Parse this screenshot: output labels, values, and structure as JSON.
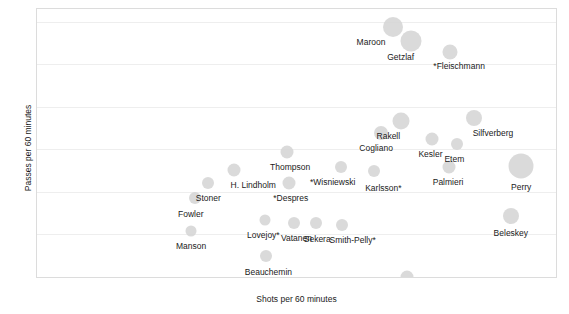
{
  "chart_data": {
    "type": "scatter",
    "title": "",
    "xlabel": "Shots per 60 minutes",
    "ylabel": "Passes per 60 minutes",
    "xlim": [
      0,
      10
    ],
    "ylim": [
      0,
      12.6
    ],
    "xticks": [
      0,
      1,
      2,
      3,
      4,
      5,
      6,
      7,
      8,
      9,
      10
    ],
    "yticks": [
      0,
      2,
      4,
      6,
      8,
      10,
      12
    ],
    "grid": true,
    "legend": "none",
    "size_encodes": "bubble area",
    "points": [
      {
        "label": "Maroon",
        "x": 6.86,
        "y": 11.75,
        "size": 20,
        "label_dx": -22,
        "label_dy": 10
      },
      {
        "label": "Getzlaf",
        "x": 7.2,
        "y": 11.1,
        "size": 21,
        "label_dx": -10,
        "label_dy": 11
      },
      {
        "label": "*Fleischmann",
        "x": 7.96,
        "y": 10.6,
        "size": 15,
        "label_dx": 9,
        "label_dy": 9
      },
      {
        "label": "Rakell",
        "x": 7.02,
        "y": 7.32,
        "size": 17,
        "label_dx": -13,
        "label_dy": 10
      },
      {
        "label": "Silfverberg",
        "x": 8.42,
        "y": 7.48,
        "size": 16,
        "label_dx": 19,
        "label_dy": 10
      },
      {
        "label": "Cogliano",
        "x": 6.63,
        "y": 6.78,
        "size": 14,
        "label_dx": -5,
        "label_dy": 10
      },
      {
        "label": "Kesler",
        "x": 7.62,
        "y": 6.5,
        "size": 13,
        "label_dx": -2,
        "label_dy": 10
      },
      {
        "label": "Etem",
        "x": 8.1,
        "y": 6.25,
        "size": 12,
        "label_dx": -3,
        "label_dy": 10
      },
      {
        "label": "Palmieri",
        "x": 7.94,
        "y": 5.18,
        "size": 13,
        "label_dx": -1,
        "label_dy": 10
      },
      {
        "label": "Perry",
        "x": 9.33,
        "y": 5.22,
        "size": 25,
        "label_dx": 0,
        "label_dy": 16
      },
      {
        "label": "Thompson",
        "x": 4.82,
        "y": 5.88,
        "size": 13,
        "label_dx": 3,
        "label_dy": 10
      },
      {
        "label": "*Wisniewski",
        "x": 5.85,
        "y": 5.18,
        "size": 12,
        "label_dx": -8,
        "label_dy": 10
      },
      {
        "label": "Karlsson*",
        "x": 6.5,
        "y": 4.98,
        "size": 12,
        "label_dx": 9,
        "label_dy": 12
      },
      {
        "label": "H. Lindholm",
        "x": 3.8,
        "y": 5.05,
        "size": 13,
        "label_dx": 19,
        "label_dy": 10
      },
      {
        "label": "Stoner",
        "x": 3.3,
        "y": 4.42,
        "size": 12,
        "label_dx": 0,
        "label_dy": 10
      },
      {
        "label": "*Despres",
        "x": 4.85,
        "y": 4.42,
        "size": 13,
        "label_dx": 2,
        "label_dy": 10
      },
      {
        "label": "Fowler",
        "x": 3.04,
        "y": 3.72,
        "size": 12,
        "label_dx": -4,
        "label_dy": 11
      },
      {
        "label": "Lovejoy*",
        "x": 4.4,
        "y": 2.68,
        "size": 11,
        "label_dx": -2,
        "label_dy": 10
      },
      {
        "label": "Vatanen",
        "x": 4.96,
        "y": 2.52,
        "size": 12,
        "label_dx": 2,
        "label_dy": 10
      },
      {
        "label": "Sekera",
        "x": 5.38,
        "y": 2.52,
        "size": 12,
        "label_dx": 1,
        "label_dy": 11
      },
      {
        "label": "Smith-Pelly*",
        "x": 5.87,
        "y": 2.45,
        "size": 12,
        "label_dx": 11,
        "label_dy": 10
      },
      {
        "label": "Manson",
        "x": 2.97,
        "y": 2.18,
        "size": 11,
        "label_dx": 0,
        "label_dy": 10
      },
      {
        "label": "Beauchemin",
        "x": 4.42,
        "y": 1.0,
        "size": 12,
        "label_dx": 2,
        "label_dy": 11
      },
      {
        "label": "Beleskey",
        "x": 9.13,
        "y": 2.88,
        "size": 16,
        "label_dx": 0,
        "label_dy": 12
      },
      {
        "label": "T. Jackman",
        "x": 7.12,
        "y": 0.02,
        "size": 13,
        "label_dx": 0,
        "label_dy": 9
      }
    ]
  },
  "colors": {
    "bubble": "#d4d4d4",
    "grid": "#eeeeee",
    "zero_line": "#8a8a8a",
    "frame": "#dcdcdc",
    "text": "#1a1a1a"
  }
}
